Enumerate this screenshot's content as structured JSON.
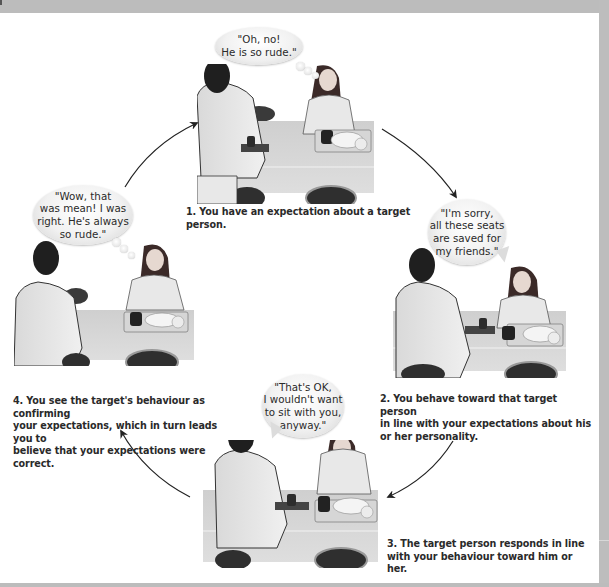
{
  "figure": {
    "colors": {
      "frame": "#bdbdbd",
      "canvas": "#ffffff",
      "caption_text": "#2a2a2a",
      "arrow": "#222222"
    },
    "steps": [
      {
        "number": "1",
        "caption": "1. You have an expectation about a target person.",
        "bubble_type": "thought",
        "bubble_text": "\"Oh, no!\nHe is so rude.\""
      },
      {
        "number": "2",
        "caption": "2. You behave toward that target person\nin line with your expectations about his\nor her personality.",
        "bubble_type": "speech",
        "bubble_text": "\"I'm sorry,\nall these seats\nare saved for\nmy friends.\""
      },
      {
        "number": "3",
        "caption": "3. The target person responds in line\nwith your behaviour toward him or her.",
        "bubble_type": "speech",
        "bubble_text": "\"That's OK,\nI wouldn't want\nto sit with you,\nanyway.\""
      },
      {
        "number": "4",
        "caption": " 4. You see the target's behaviour as confirming\nyour expectations, which in turn leads you to\nbelieve that your expectations were correct.",
        "bubble_type": "thought",
        "bubble_text": "\"Wow, that\nwas mean! I was\nright. He's always\nso rude.\""
      }
    ],
    "cycle_arrows": [
      {
        "from": "step-1",
        "to": "step-2"
      },
      {
        "from": "step-2",
        "to": "step-3"
      },
      {
        "from": "step-3",
        "to": "step-4"
      },
      {
        "from": "step-4",
        "to": "step-1"
      }
    ]
  }
}
